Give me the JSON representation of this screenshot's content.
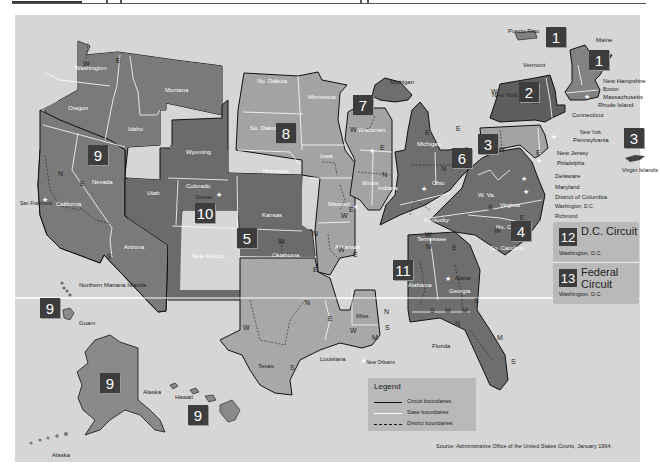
{
  "map": {
    "title": "United States Courts of Appeals and District Courts",
    "colors": {
      "background": "#d6d6d6",
      "circuit_dark": "#6a6a6a",
      "circuit_mid": "#7d7d7d",
      "circuit_light": "#a3a3a3",
      "badge": "#3d3d3d",
      "state_boundary": "#ffffff",
      "circuit_boundary": "#111111"
    },
    "circuits": [
      {
        "number": "1",
        "states": [
          "Maine",
          "New Hampshire",
          "Massachusetts",
          "Rhode Island",
          "Puerto Rico"
        ]
      },
      {
        "number": "2",
        "states": [
          "Vermont",
          "New York",
          "Connecticut"
        ]
      },
      {
        "number": "3",
        "states": [
          "Pennsylvania",
          "New Jersey",
          "Delaware",
          "Virgin Islands"
        ]
      },
      {
        "number": "4",
        "states": [
          "Maryland",
          "W. Va.",
          "Virginia",
          "No. Carolina",
          "So. Carolina"
        ]
      },
      {
        "number": "5",
        "states": [
          "Texas",
          "Louisiana",
          "Miss."
        ]
      },
      {
        "number": "6",
        "states": [
          "Michigan",
          "Ohio",
          "Kentucky",
          "Tennessee"
        ]
      },
      {
        "number": "7",
        "states": [
          "Wisconsin",
          "Illinois",
          "Indiana"
        ]
      },
      {
        "number": "8",
        "states": [
          "No. Dakota",
          "So. Dakota",
          "Nebraska",
          "Minnesota",
          "Iowa",
          "Missouri",
          "Arkansas"
        ]
      },
      {
        "number": "9",
        "states": [
          "Washington",
          "Oregon",
          "California",
          "Nevada",
          "Idaho",
          "Montana",
          "Arizona",
          "Alaska",
          "Hawaii",
          "Guam",
          "Northern Mariana Islands"
        ]
      },
      {
        "number": "10",
        "states": [
          "Wyoming",
          "Utah",
          "Colorado",
          "Kansas",
          "New Mexico",
          "Oklahoma"
        ]
      },
      {
        "number": "11",
        "states": [
          "Alabama",
          "Georgia",
          "Florida"
        ]
      },
      {
        "number": "12",
        "name": "D.C. Circuit",
        "location": "Washington, D.C."
      },
      {
        "number": "13",
        "name": "Federal Circuit",
        "location": "Washington, D.C."
      }
    ],
    "state_labels": {
      "washington": "Washington",
      "oregon": "Oregon",
      "idaho": "Idaho",
      "montana": "Montana",
      "nevada": "Nevada",
      "california": "California",
      "arizona": "Arizona",
      "utah": "Utah",
      "wyoming": "Wyoming",
      "colorado": "Colorado",
      "new_mexico": "New Mexico",
      "kansas": "Kansas",
      "oklahoma": "Oklahoma",
      "texas": "Texas",
      "no_dakota": "No. Dakota",
      "so_dakota": "So. Dakota",
      "nebraska": "Nebraska",
      "minnesota": "Minnesota",
      "iowa": "Iowa",
      "missouri": "Missouri",
      "arkansas": "Arkansas",
      "louisiana": "Louisiana",
      "miss": "Miss.",
      "wisconsin": "Wisconsin",
      "illinois": "Illinois",
      "indiana": "Indiana",
      "michigan": "Michigan",
      "michigan_up": "Michigan",
      "ohio": "Ohio",
      "kentucky": "Kentucky",
      "tennessee": "Tennessee",
      "alabama": "Alabama",
      "georgia": "Georgia",
      "florida": "Florida",
      "w_va": "W. Va.",
      "virginia": "Virginia",
      "no_carolina": "No. Carolina",
      "so_carolina": "So. Carolina",
      "maine": "Maine",
      "vermont": "Vermont",
      "new_york": "New York",
      "new_hampshire": "New Hampshire",
      "massachusetts": "Massachusetts",
      "rhode_island": "Rhode Island",
      "connecticut": "Connecticut",
      "pennsylvania": "Pennsylvania",
      "new_jersey": "New Jersey",
      "delaware": "Delaware",
      "maryland": "Maryland",
      "district_of_columbia": "District of Columbia",
      "puerto_rico": "Puerto Rico",
      "virgin_islands": "Virgin Islands",
      "alaska": "Alaska",
      "hawaii": "Hawaii",
      "guam": "Guam",
      "northern_mariana": "Northern Mariana Islands"
    },
    "cities": {
      "san_francisco": "San Francisco",
      "denver": "Denver",
      "st_louis": "St. Louis",
      "chicago": "Chicago",
      "cincinnati": "Cincinnati",
      "new_orleans": "New Orleans",
      "atlanta": "Atlanta",
      "richmond": "Richmond",
      "washington_dc": "Washington, D.C.",
      "philadelphia": "Philadelphia",
      "new_york": "New York",
      "boston": "Boston"
    },
    "dc_box": {
      "c12": {
        "number": "12",
        "name": "D.C. Circuit",
        "location": "Washington, D.C."
      },
      "c13": {
        "number": "13",
        "name": "Federal Circuit",
        "location": "Washington, D.C."
      }
    },
    "legend": {
      "title": "Legend",
      "items": [
        {
          "label": "Circuit boundaries",
          "style": "solid-black"
        },
        {
          "label": "State boundaries",
          "style": "solid-white"
        },
        {
          "label": "District boundaries",
          "style": "dashed-black"
        }
      ]
    },
    "source": "Source: Administrative Office of the United States Courts, January 1994."
  }
}
